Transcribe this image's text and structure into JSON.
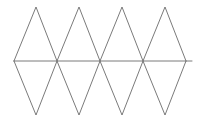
{
  "figure": {
    "background_color": "#ffffff",
    "stroke_color": "#6b6b6b",
    "stroke_width": 0.9,
    "width": 205,
    "height": 122
  },
  "chart_data": {
    "type": "line",
    "xlabel": "",
    "ylabel": "",
    "xlim": [
      0,
      205
    ],
    "ylim": [
      122,
      0
    ],
    "grid": false,
    "legend": "none",
    "annotations": [
      "Zigzag strip of 8 triangles sharing a horizontal midline",
      "4 upward-pointing triangles with apexes on the top row",
      "4 downward-pointing triangles with apexes on the bottom row"
    ],
    "geometry": {
      "baseline_y": 61,
      "top_apex_y": 7,
      "bottom_apex_y": 115,
      "baseline_x_start": 14,
      "baseline_x_end": 192,
      "top_apex_x": [
        36,
        79,
        122,
        165
      ],
      "bottom_apex_x": [
        57,
        100,
        143,
        186
      ],
      "baseline_node_x": [
        14,
        57,
        100,
        143,
        186
      ]
    },
    "series": [
      {
        "name": "baseline",
        "points": [
          [
            14,
            61
          ],
          [
            192,
            61
          ]
        ]
      },
      {
        "name": "upper-zigzag",
        "points": [
          [
            14,
            61
          ],
          [
            36,
            7
          ],
          [
            57,
            61
          ],
          [
            79,
            7
          ],
          [
            100,
            61
          ],
          [
            122,
            7
          ],
          [
            143,
            61
          ],
          [
            165,
            7
          ],
          [
            186,
            61
          ]
        ]
      },
      {
        "name": "lower-zigzag",
        "points": [
          [
            14,
            61
          ],
          [
            36,
            115
          ],
          [
            57,
            61
          ],
          [
            79,
            115
          ],
          [
            100,
            61
          ],
          [
            122,
            115
          ],
          [
            143,
            61
          ],
          [
            165,
            115
          ],
          [
            186,
            61
          ]
        ]
      }
    ]
  }
}
